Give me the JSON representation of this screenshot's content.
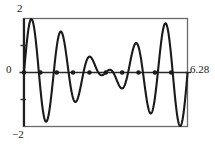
{
  "chart_data": {
    "type": "line",
    "title": "",
    "xlabel": "",
    "ylabel": "",
    "xlim": [
      0,
      6.28
    ],
    "ylim": [
      -2,
      2
    ],
    "grid": false,
    "legend": null,
    "axis_labels": {
      "y_max": "2",
      "y_zero": "0",
      "y_min": "−2",
      "x_max": "6.28"
    },
    "y_ticks": [
      -1,
      1
    ],
    "series": [
      {
        "name": "waveform",
        "color": "#1a1a1a",
        "x": [
          0.0,
          0.05,
          0.1,
          0.15,
          0.2,
          0.25,
          0.3,
          0.35,
          0.4,
          0.45,
          0.5,
          0.55,
          0.6,
          0.65,
          0.7,
          0.75,
          0.8,
          0.85,
          0.9,
          0.95,
          1.0,
          1.05,
          1.1,
          1.15,
          1.2,
          1.25,
          1.3,
          1.35,
          1.4,
          1.45,
          1.5,
          1.55,
          1.6,
          1.65,
          1.7,
          1.75,
          1.8,
          1.85,
          1.9,
          1.95,
          2.0,
          2.05,
          2.1,
          2.15,
          2.2,
          2.25,
          2.3,
          2.35,
          2.4,
          2.45,
          2.5,
          2.55,
          2.6,
          2.65,
          2.7,
          2.75,
          2.8,
          2.85,
          2.9,
          2.95,
          3.0,
          3.05,
          3.1,
          3.15,
          3.2,
          3.25,
          3.3,
          3.35,
          3.4,
          3.45,
          3.5,
          3.55,
          3.6,
          3.65,
          3.7,
          3.75,
          3.8,
          3.85,
          3.9,
          3.95,
          4.0,
          4.05,
          4.1,
          4.15,
          4.2,
          4.25,
          4.3,
          4.35,
          4.4,
          4.45,
          4.5,
          4.55,
          4.6,
          4.65,
          4.7,
          4.75,
          4.8,
          4.85,
          4.9,
          4.95,
          5.0,
          5.05,
          5.1,
          5.15,
          5.2,
          5.25,
          5.3,
          5.35,
          5.4,
          5.45,
          5.5,
          5.55,
          5.6,
          5.65,
          5.7,
          5.75,
          5.8,
          5.85,
          5.9,
          5.95,
          6.0,
          6.05,
          6.1,
          6.15,
          6.2,
          6.25,
          6.28
        ],
        "formula": "sin(5x) + sin(6x)"
      }
    ],
    "zero_crossing_markers_x": [
      0.0,
      0.628,
      1.257,
      1.885,
      2.513,
      3.142,
      3.77,
      4.398,
      5.027,
      5.655
    ],
    "marker_style": "filled-circle"
  },
  "figure": {
    "frame_color": "#555555",
    "curve_color": "#1a1a1a",
    "axis_color": "#2a2a2a",
    "background": "#ffffff"
  }
}
